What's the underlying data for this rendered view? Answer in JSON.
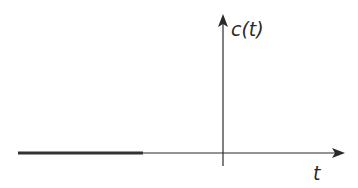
{
  "diagram": {
    "type": "signal-plot",
    "y_axis_label": "c(t)",
    "x_axis_label": "t",
    "colors": {
      "axis": "#2a2a2a",
      "signal": "#333333",
      "background": "#ffffff"
    },
    "signal": {
      "description": "thick horizontal segment on the t-axis at the far negative-t region",
      "value": 0
    }
  }
}
